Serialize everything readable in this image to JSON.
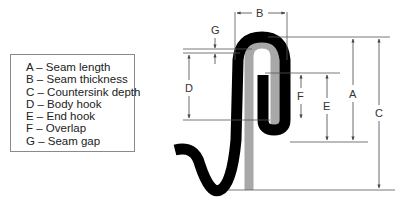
{
  "legend": {
    "items": [
      {
        "key": "A",
        "text": "A – Seam length"
      },
      {
        "key": "B",
        "text": "B – Seam thickness"
      },
      {
        "key": "C",
        "text": "C – Countersink depth"
      },
      {
        "key": "D",
        "text": "D – Body hook"
      },
      {
        "key": "E",
        "text": "E – End hook"
      },
      {
        "key": "F",
        "text": "F – Overlap"
      },
      {
        "key": "G",
        "text": "G – Seam gap"
      }
    ]
  },
  "dimension_labels": {
    "A": "A",
    "B": "B",
    "C": "C",
    "D": "D",
    "E": "E",
    "F": "F",
    "G": "G"
  },
  "colors": {
    "end_metal": "#000000",
    "body_metal": "#a8a8a8",
    "dimension_lines": "#555555"
  }
}
